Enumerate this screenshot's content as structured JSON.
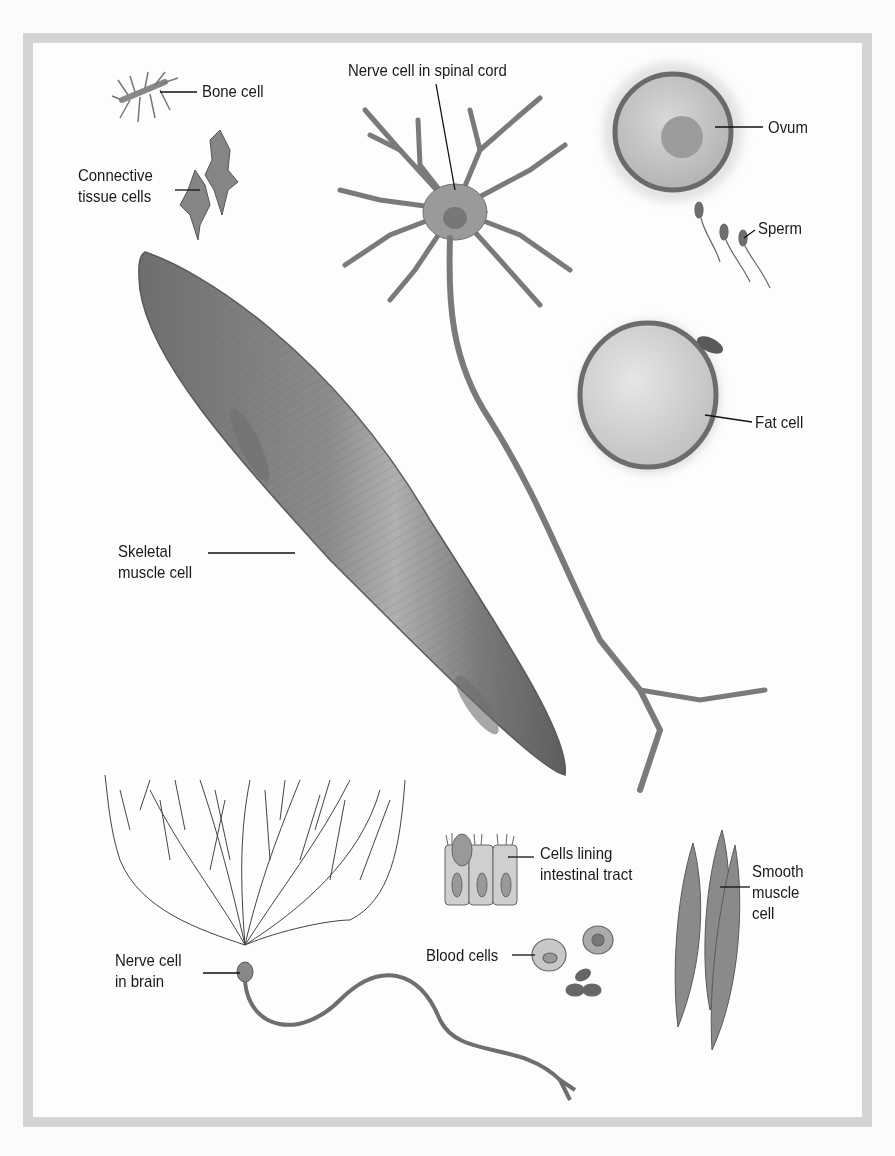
{
  "diagram": {
    "title": "",
    "colors": {
      "frame": "#d4d4d4",
      "background": "#fdfdfd",
      "cell_fill": "#8a8a8a",
      "cell_dark": "#5a5a5a",
      "label_text": "#1a1a1a"
    },
    "labels": [
      {
        "id": "bone",
        "lines": [
          "Bone cell"
        ]
      },
      {
        "id": "connective",
        "lines": [
          "Connective",
          "tissue cells"
        ]
      },
      {
        "id": "spinal",
        "lines": [
          "Nerve cell in spinal cord"
        ]
      },
      {
        "id": "ovum",
        "lines": [
          "Ovum"
        ]
      },
      {
        "id": "sperm",
        "lines": [
          "Sperm"
        ]
      },
      {
        "id": "fat",
        "lines": [
          "Fat cell"
        ]
      },
      {
        "id": "skeletal",
        "lines": [
          "Skeletal",
          "muscle cell"
        ]
      },
      {
        "id": "intestinal",
        "lines": [
          "Cells lining",
          "intestinal tract"
        ]
      },
      {
        "id": "smooth",
        "lines": [
          "Smooth",
          "muscle",
          "cell"
        ]
      },
      {
        "id": "brain",
        "lines": [
          "Nerve cell",
          "in brain"
        ]
      },
      {
        "id": "blood",
        "lines": [
          "Blood cells"
        ]
      }
    ]
  }
}
